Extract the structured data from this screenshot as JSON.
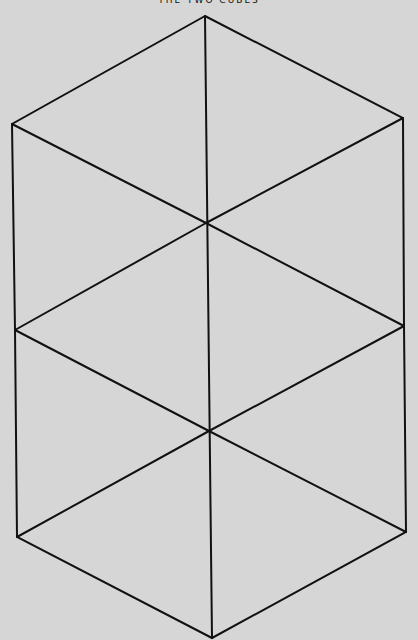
{
  "title": "THE TWO CUBES",
  "colors": {
    "background": "#d6d6d6",
    "line": "#111111"
  },
  "vertices": {
    "top": [
      205,
      16
    ],
    "left_top": [
      12,
      124
    ],
    "right_top": [
      403,
      118
    ],
    "center_upper": [
      206,
      223
    ],
    "left_mid": [
      15,
      330
    ],
    "right_mid": [
      404,
      326
    ],
    "center_lower": [
      209,
      431
    ],
    "left_bottom": [
      17,
      537
    ],
    "right_bottom": [
      406,
      532
    ],
    "bottom": [
      212,
      638
    ]
  }
}
